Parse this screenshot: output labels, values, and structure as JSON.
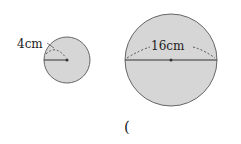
{
  "figure": {
    "small_circle": {
      "label": "4cm",
      "measure": "radius",
      "cx": 67,
      "cy": 60,
      "r": 23
    },
    "large_circle": {
      "label": "16cm",
      "measure": "diameter",
      "cx": 171,
      "cy": 60,
      "r": 46
    },
    "answer_bracket": "(",
    "colors": {
      "fill": "#d6d6d6",
      "stroke": "#555555",
      "text": "#222222"
    }
  }
}
